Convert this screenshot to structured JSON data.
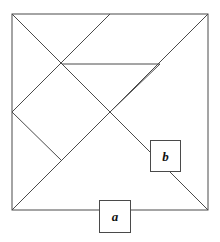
{
  "figure": {
    "stroke_color": "#4a4a4a",
    "stroke_width": 1,
    "background_color": "#ffffff",
    "square": {
      "left": 12,
      "top": 14,
      "right": 208,
      "bottom": 210,
      "side": 196
    },
    "points": {
      "top_left": [
        12,
        14
      ],
      "top_mid": [
        110,
        14
      ],
      "top_right": [
        208,
        14
      ],
      "left_mid": [
        12,
        112
      ],
      "center": [
        110,
        112
      ],
      "right_mid": [
        208,
        112
      ],
      "bottom_left": [
        12,
        210
      ],
      "bottom_mid": [
        110,
        210
      ],
      "bottom_right": [
        208,
        210
      ],
      "upper_left_quarter": [
        62,
        64
      ],
      "lower_left_quarter": [
        62,
        161
      ],
      "upper_right_quarter": [
        160,
        64
      ]
    },
    "segments": [
      {
        "name": "square-top-edge",
        "from": [
          12,
          14
        ],
        "to": [
          208,
          14
        ]
      },
      {
        "name": "square-right-edge",
        "from": [
          208,
          14
        ],
        "to": [
          208,
          210
        ]
      },
      {
        "name": "square-bottom-edge",
        "from": [
          208,
          210
        ],
        "to": [
          12,
          210
        ]
      },
      {
        "name": "square-left-edge",
        "from": [
          12,
          210
        ],
        "to": [
          12,
          14
        ]
      },
      {
        "name": "main-diagonal-topleft-to-bottomright",
        "from": [
          12,
          14
        ],
        "to": [
          208,
          210
        ]
      },
      {
        "name": "anti-diagonal-topright-to-bottomleft",
        "from": [
          208,
          14
        ],
        "to": [
          12,
          210
        ]
      },
      {
        "name": "horizontal-mid-chord",
        "from": [
          62,
          64
        ],
        "to": [
          160,
          64
        ]
      },
      {
        "name": "diagonal-left-mid-to-top-mid",
        "from": [
          12,
          112
        ],
        "to": [
          110,
          14
        ]
      },
      {
        "name": "diagonal-left-mid-to-lower-quarter",
        "from": [
          12,
          112
        ],
        "to": [
          62,
          161
        ]
      },
      {
        "name": "diagonal-upper-quarter-to-center",
        "from": [
          62,
          64
        ],
        "to": [
          110,
          112
        ]
      },
      {
        "name": "diagonal-center-to-right-mid",
        "from": [
          110,
          112
        ],
        "to": [
          160,
          64
        ]
      }
    ]
  },
  "labels": {
    "a": {
      "text": "a",
      "name": "label-a",
      "position": "bottom-edge-midpoint"
    },
    "b": {
      "text": "b",
      "name": "label-b",
      "position": "on-main-diagonal-lower-right"
    }
  }
}
